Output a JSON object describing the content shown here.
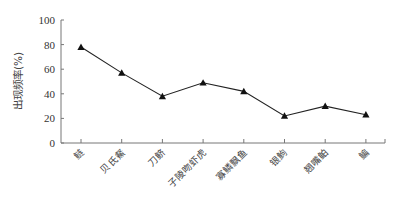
{
  "chart_data": {
    "type": "line",
    "title": "",
    "xlabel": "",
    "ylabel": "出现频率(%)",
    "ylim": [
      0,
      100
    ],
    "yticks": [
      0,
      20,
      40,
      60,
      80,
      100
    ],
    "grid": false,
    "legend": null,
    "marker": "triangle",
    "line_color": "#222222",
    "categories": [
      "鲢",
      "贝氏䱗",
      "刀鲚",
      "子陵吻虾虎",
      "寡鳞飘鱼",
      "银鮈",
      "翘嘴鲌",
      "鳊"
    ],
    "values": [
      78,
      57,
      38,
      49,
      42,
      22,
      30,
      23
    ]
  }
}
